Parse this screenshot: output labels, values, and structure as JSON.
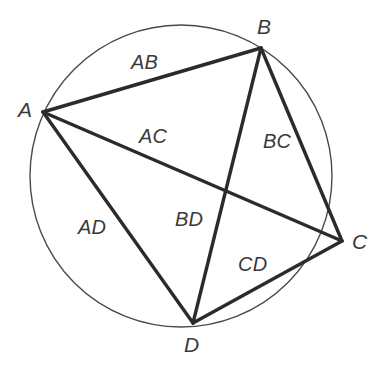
{
  "figure": {
    "kind": "cyclic-quadrilateral-diagram",
    "colors": {
      "background": "#ffffff",
      "circle_stroke": "#4a4a4a",
      "chord_stroke": "#2b2b2b",
      "label_text": "#3a3a3a"
    },
    "circle": {
      "cx": 181,
      "cy": 176,
      "r": 151,
      "stroke_width": 1.4
    },
    "chord_stroke_width": 3.4,
    "vertices": [
      {
        "id": "A",
        "label": "A",
        "x": 43,
        "y": 112,
        "label_x": 18,
        "label_y": 99
      },
      {
        "id": "B",
        "label": "B",
        "x": 261,
        "y": 48,
        "label_x": 257,
        "label_y": 16
      },
      {
        "id": "C",
        "label": "C",
        "x": 342,
        "y": 241,
        "label_x": 352,
        "label_y": 231
      },
      {
        "id": "D",
        "label": "D",
        "x": 193,
        "y": 323,
        "label_x": 184,
        "label_y": 334
      }
    ],
    "segments": [
      {
        "id": "AB",
        "label": "AB",
        "from": "A",
        "to": "B",
        "role": "side",
        "label_x": 131,
        "label_y": 52
      },
      {
        "id": "BC",
        "label": "BC",
        "from": "B",
        "to": "C",
        "role": "side",
        "label_x": 263,
        "label_y": 131
      },
      {
        "id": "CD",
        "label": "CD",
        "from": "C",
        "to": "D",
        "role": "side",
        "label_x": 238,
        "label_y": 254
      },
      {
        "id": "AD",
        "label": "AD",
        "from": "A",
        "to": "D",
        "role": "side",
        "label_x": 78,
        "label_y": 217
      },
      {
        "id": "AC",
        "label": "AC",
        "from": "A",
        "to": "C",
        "role": "diagonal",
        "label_x": 139,
        "label_y": 126
      },
      {
        "id": "BD",
        "label": "BD",
        "from": "B",
        "to": "D",
        "role": "diagonal",
        "label_x": 175,
        "label_y": 209
      }
    ],
    "intersection": {
      "id": "AC-BD",
      "x": 224,
      "y": 190
    }
  }
}
